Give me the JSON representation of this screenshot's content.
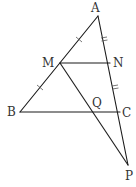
{
  "diagram": {
    "type": "geometry",
    "points": {
      "A": {
        "label": "A",
        "x": 98,
        "y": 16,
        "lx": 91,
        "ly": 12
      },
      "M": {
        "label": "M",
        "x": 60,
        "y": 63,
        "lx": 42,
        "ly": 67
      },
      "N": {
        "label": "N",
        "x": 110,
        "y": 63,
        "lx": 113,
        "ly": 67
      },
      "B": {
        "label": "B",
        "x": 20,
        "y": 112,
        "lx": 7,
        "ly": 116
      },
      "Q": {
        "label": "Q",
        "x": 95,
        "y": 112,
        "lx": 92,
        "ly": 107
      },
      "C": {
        "label": "C",
        "x": 120,
        "y": 112,
        "lx": 122,
        "ly": 117
      },
      "P": {
        "label": "P",
        "x": 128,
        "y": 165,
        "lx": 125,
        "ly": 180
      }
    },
    "segments": [
      [
        "A",
        "B"
      ],
      [
        "A",
        "P"
      ],
      [
        "B",
        "C"
      ],
      [
        "M",
        "N"
      ],
      [
        "M",
        "P"
      ]
    ],
    "equal_marks": {
      "single": [
        "AM",
        "MB"
      ],
      "double": [
        "AN",
        "NC"
      ]
    },
    "colors": {
      "line": "#1a1a1a",
      "label": "#333333",
      "background": "#ffffff"
    }
  }
}
